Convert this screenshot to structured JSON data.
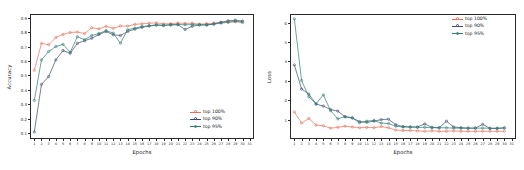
{
  "figure": {
    "background": "#ffffff",
    "series_colors": {
      "top100": "#e8705a",
      "top90": "#3b4a6b",
      "top95": "#2e7d72"
    }
  },
  "charts": [
    {
      "id": "accuracy-chart",
      "type": "line",
      "title": "",
      "xlabel": "Epochs",
      "ylabel": "Accuracy",
      "xlim": [
        0.4,
        31.6
      ],
      "ylim": [
        0.06,
        0.925
      ],
      "yticks": [
        "0.1",
        "0.2",
        "0.3",
        "0.4",
        "0.5",
        "0.6",
        "0.7",
        "0.8",
        "0.9"
      ],
      "ytick_values": [
        0.1,
        0.2,
        0.3,
        0.4,
        0.5,
        0.6,
        0.7,
        0.8,
        0.9
      ],
      "xticks": [
        "1",
        "2",
        "3",
        "4",
        "5",
        "6",
        "7",
        "8",
        "9",
        "10",
        "11",
        "12",
        "13",
        "14",
        "15",
        "16",
        "17",
        "18",
        "19",
        "20",
        "21",
        "22",
        "23",
        "24",
        "25",
        "26",
        "27",
        "28",
        "29",
        "30",
        "31"
      ],
      "grid": false,
      "legend_position": "lower right",
      "x": [
        1,
        2,
        3,
        4,
        5,
        6,
        7,
        8,
        9,
        10,
        11,
        12,
        13,
        14,
        15,
        16,
        17,
        18,
        19,
        20,
        21,
        22,
        23,
        24,
        25,
        26,
        27,
        28,
        29,
        30
      ],
      "series": [
        {
          "name": "top 100%",
          "color": "#e8705a",
          "values": [
            0.535,
            0.722,
            0.712,
            0.762,
            0.784,
            0.797,
            0.8,
            0.79,
            0.83,
            0.822,
            0.84,
            0.826,
            0.842,
            0.841,
            0.853,
            0.857,
            0.861,
            0.864,
            0.857,
            0.858,
            0.862,
            0.86,
            0.861,
            0.855,
            0.858,
            0.862,
            0.866,
            0.871,
            0.872,
            0.873
          ]
        },
        {
          "name": "top 90%",
          "color": "#3b4a6b",
          "values": [
            0.108,
            0.438,
            0.492,
            0.608,
            0.672,
            0.653,
            0.722,
            0.74,
            0.757,
            0.783,
            0.804,
            0.781,
            0.776,
            0.804,
            0.82,
            0.833,
            0.842,
            0.848,
            0.845,
            0.849,
            0.851,
            0.818,
            0.84,
            0.85,
            0.848,
            0.856,
            0.868,
            0.878,
            0.882,
            0.876
          ]
        },
        {
          "name": "top 95%",
          "color": "#2e7d72",
          "values": [
            0.327,
            0.608,
            0.665,
            0.7,
            0.715,
            0.66,
            0.768,
            0.747,
            0.776,
            0.79,
            0.81,
            0.793,
            0.723,
            0.816,
            0.827,
            0.838,
            0.844,
            0.85,
            0.847,
            0.851,
            0.853,
            0.85,
            0.852,
            0.849,
            0.851,
            0.855,
            0.862,
            0.867,
            0.873,
            0.866
          ]
        }
      ]
    },
    {
      "id": "loss-chart",
      "type": "line",
      "title": "",
      "xlabel": "Epochs",
      "ylabel": "Loss",
      "xlim": [
        0.4,
        31.6
      ],
      "ylim": [
        0.0,
        6.45
      ],
      "yticks": [
        "1",
        "2",
        "3",
        "4",
        "5",
        "6"
      ],
      "ytick_values": [
        1,
        2,
        3,
        4,
        5,
        6
      ],
      "xticks": [
        "1",
        "2",
        "3",
        "4",
        "5",
        "6",
        "7",
        "8",
        "9",
        "10",
        "11",
        "12",
        "13",
        "14",
        "15",
        "16",
        "17",
        "18",
        "19",
        "20",
        "21",
        "22",
        "23",
        "24",
        "25",
        "26",
        "27",
        "28",
        "29",
        "30",
        "31"
      ],
      "grid": false,
      "legend_position": "upper right",
      "x": [
        1,
        2,
        3,
        4,
        5,
        6,
        7,
        8,
        9,
        10,
        11,
        12,
        13,
        14,
        15,
        16,
        17,
        18,
        19,
        20,
        21,
        22,
        23,
        24,
        25,
        26,
        27,
        28,
        29,
        30
      ],
      "series": [
        {
          "name": "top 100%",
          "color": "#e8705a",
          "values": [
            1.4,
            0.82,
            1.06,
            0.72,
            0.68,
            0.56,
            0.6,
            0.66,
            0.62,
            0.58,
            0.6,
            0.58,
            0.64,
            0.58,
            0.46,
            0.44,
            0.44,
            0.42,
            0.4,
            0.42,
            0.4,
            0.4,
            0.42,
            0.4,
            0.4,
            0.4,
            0.4,
            0.4,
            0.4,
            0.4
          ]
        },
        {
          "name": "top 90%",
          "color": "#3b4a6b",
          "values": [
            3.82,
            2.58,
            2.32,
            1.8,
            1.7,
            1.52,
            1.44,
            1.14,
            1.1,
            0.9,
            0.86,
            0.92,
            1.0,
            1.02,
            0.74,
            0.64,
            0.62,
            0.62,
            0.78,
            0.6,
            0.58,
            0.92,
            0.62,
            0.58,
            0.56,
            0.56,
            0.76,
            0.54,
            0.54,
            0.58
          ]
        },
        {
          "name": "top 95%",
          "color": "#2e7d72",
          "values": [
            6.2,
            3.02,
            2.18,
            1.82,
            2.28,
            1.46,
            1.04,
            1.16,
            1.08,
            0.84,
            0.92,
            0.96,
            0.82,
            0.8,
            0.66,
            0.62,
            0.62,
            0.6,
            0.6,
            0.58,
            0.58,
            0.58,
            0.56,
            0.56,
            0.56,
            0.56,
            0.56,
            0.56,
            0.56,
            0.56
          ]
        }
      ]
    }
  ]
}
